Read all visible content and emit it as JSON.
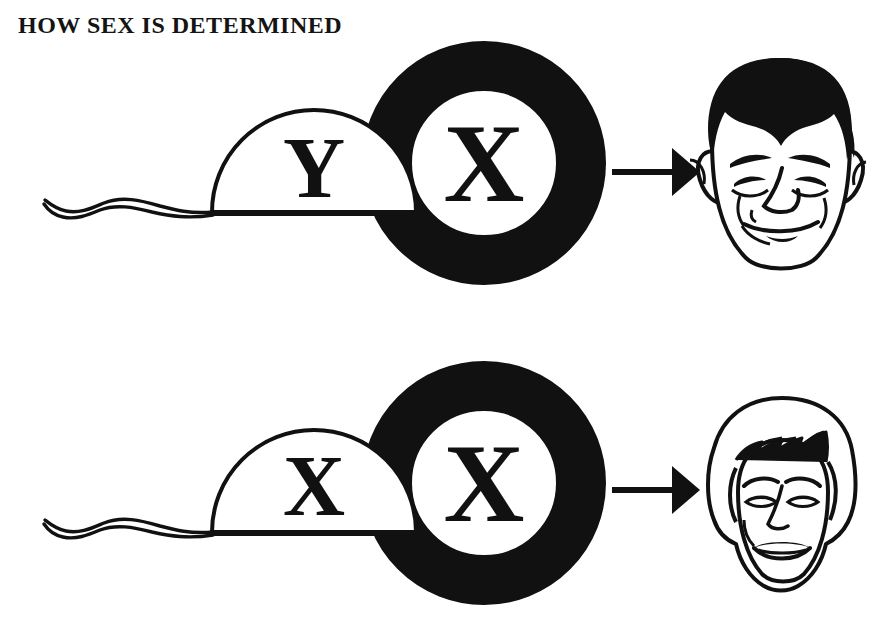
{
  "page": {
    "title": "HOW SEX IS DETERMINED",
    "background_color": "#ffffff",
    "ink_color": "#111111"
  },
  "legend": {
    "sperm_label": "sperm",
    "egg_label": "egg",
    "arrow_label": "results in",
    "result_label": "offspring"
  },
  "rows": [
    {
      "id": "male-outcome",
      "sperm": {
        "name": "sperm-cell",
        "chromosome": "Y",
        "shape": "dome-with-wavy-tail"
      },
      "egg": {
        "name": "egg-cell",
        "chromosome": "X",
        "shape": "thick-black-ring"
      },
      "arrow": {
        "name": "result-arrow",
        "direction": "right"
      },
      "result": {
        "name": "male-face",
        "sex": "male",
        "description": "smiling man's face with dark hair"
      }
    },
    {
      "id": "female-outcome",
      "sperm": {
        "name": "sperm-cell",
        "chromosome": "X",
        "shape": "dome-with-wavy-tail"
      },
      "egg": {
        "name": "egg-cell",
        "chromosome": "X",
        "shape": "thick-black-ring"
      },
      "arrow": {
        "name": "result-arrow",
        "direction": "right"
      },
      "result": {
        "name": "female-face",
        "sex": "female",
        "description": "smiling woman's face with bobbed hair"
      }
    }
  ]
}
